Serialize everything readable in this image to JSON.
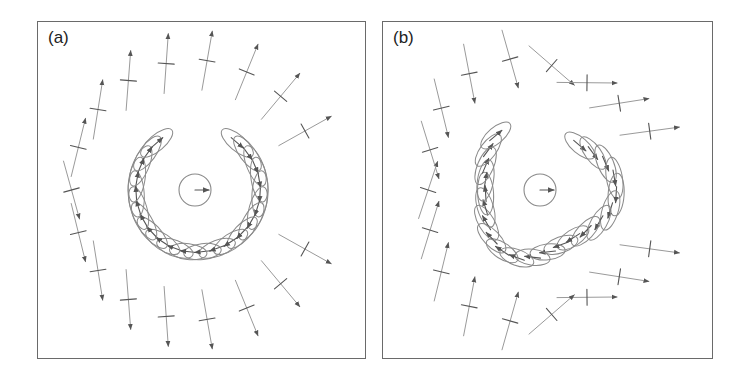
{
  "figure": {
    "panels": [
      {
        "id": "a",
        "label": "(a)",
        "box": {
          "x": 37,
          "y": 21,
          "w": 329,
          "h": 338
        },
        "center": {
          "x": 195,
          "y": 190
        },
        "circle_radius": 16,
        "ring": {
          "radius": 62,
          "stretch_right": 1.0,
          "ellipse_rx_right": 26,
          "ellipse_ry": 8,
          "count": 22
        },
        "outer_field_radius": 130,
        "shape": "circular"
      },
      {
        "id": "b",
        "label": "(b)",
        "box": {
          "x": 382,
          "y": 21,
          "w": 331,
          "h": 338
        },
        "center": {
          "x": 540,
          "y": 190
        },
        "circle_radius": 16,
        "ring": {
          "radius": 65,
          "stretch_right": 1.0,
          "ellipse_rx_right": 24,
          "ellipse_ry": 8,
          "count": 22
        },
        "outer_field_radius": 128,
        "shape": "triangular"
      }
    ],
    "colors": {
      "border": "#6a6a6a",
      "ellipse": "#8a8a8a",
      "arrow": "#555555",
      "arrow_light": "#9a9a9a",
      "text": "#222222"
    }
  }
}
